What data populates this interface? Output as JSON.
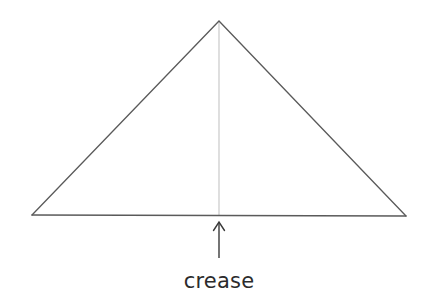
{
  "figure": {
    "canvas": {
      "width": 428,
      "height": 299,
      "background": "#ffffff"
    },
    "label": {
      "text": "crease",
      "x": 219,
      "y": 288,
      "font_size": 21,
      "color": "#2b2b2b"
    },
    "shapes": {
      "triangle": {
        "name": "folded-paper-triangle",
        "points": "32,215 219,21 406,216",
        "stroke": "#5a5a5a",
        "stroke_width": 1.3,
        "fill": "none",
        "vertices": {
          "apex": [
            219,
            21
          ],
          "bottom_left": [
            32,
            215
          ],
          "bottom_right": [
            406,
            216
          ]
        }
      },
      "crease_line": {
        "name": "crease-line",
        "x1": 219,
        "y1": 22,
        "x2": 219,
        "y2": 215,
        "stroke": "#c9c9c9",
        "stroke_width": 1.2
      },
      "baseline": {
        "name": "triangle-baseline",
        "x1": 32,
        "y1": 215,
        "x2": 406,
        "y2": 216,
        "stroke": "#5a5a5a",
        "stroke_width": 1.3
      },
      "arrow": {
        "name": "crease-pointer-arrow",
        "shaft": {
          "x1": 219,
          "y1": 258,
          "x2": 219,
          "y2": 223
        },
        "head": "213.5,230.5 219,222 224.5,230.5",
        "stroke": "#3a3a3a",
        "stroke_width": 1.4,
        "direction": "up"
      }
    }
  }
}
